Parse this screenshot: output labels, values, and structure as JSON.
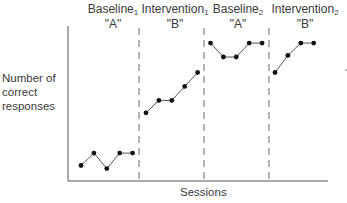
{
  "chart_data": {
    "type": "line",
    "title": "",
    "xlabel": "Sessions",
    "ylabel": "Number of correct responses",
    "y_ticks": "none (relative scale 0-10 estimated)",
    "grid": false,
    "legend": "none",
    "phase_separators": "dashed vertical lines between phases",
    "phases": [
      {
        "name": "Baseline",
        "subscript": "1",
        "code": "\"A\"",
        "sessions": [
          1,
          2,
          3,
          4,
          5
        ],
        "values": [
          1.0,
          1.8,
          0.8,
          1.8,
          1.8
        ]
      },
      {
        "name": "Intervention",
        "subscript": "1",
        "code": "\"B\"",
        "sessions": [
          6,
          7,
          8,
          9,
          10
        ],
        "values": [
          4.4,
          5.2,
          5.2,
          6.1,
          7.0
        ]
      },
      {
        "name": "Baseline",
        "subscript": "2",
        "code": "\"A\"",
        "sessions": [
          11,
          12,
          13,
          14,
          15
        ],
        "values": [
          8.9,
          8.0,
          8.0,
          8.9,
          8.9
        ]
      },
      {
        "name": "Intervention",
        "subscript": "2",
        "code": "\"B\"",
        "sessions": [
          16,
          17,
          18,
          19
        ],
        "values": [
          7.0,
          8.1,
          8.9,
          8.9
        ]
      }
    ]
  },
  "labels": {
    "p1_name": "Baseline",
    "p1_sub": "1",
    "p1_code": "\"A\"",
    "p2_name": "Intervention",
    "p2_sub": "1",
    "p2_code": "\"B\"",
    "p3_name": "Baseline",
    "p3_sub": "2",
    "p3_code": "\"A\"",
    "p4_name": "Intervention",
    "p4_sub": "2",
    "p4_code": "\"B\"",
    "ylabel_line1": "Number of",
    "ylabel_line2": "correct",
    "ylabel_line3": "responses",
    "xlabel": "Sessions"
  },
  "colors": {
    "line": "#555555",
    "point": "#111111",
    "axis": "#555555"
  }
}
